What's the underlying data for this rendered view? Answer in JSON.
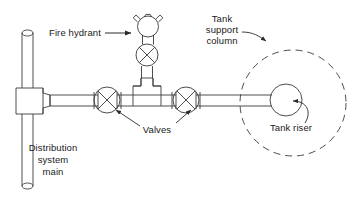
{
  "diagram": {
    "type": "piping-schematic",
    "background_color": "#ffffff",
    "line_color": "#3a3a3a",
    "text_color": "#1a1a1a",
    "canvas": {
      "width": 364,
      "height": 199
    }
  },
  "labels": {
    "fire_hydrant": "Fire hydrant",
    "tank_support_column_line1": "Tank",
    "tank_support_column_line2": "support",
    "tank_support_column_line3": "column",
    "valves": "Valves",
    "tank_riser": "Tank riser",
    "distribution_main_line1": "Distribution",
    "distribution_main_line2": "system",
    "distribution_main_line3": "main"
  },
  "components": [
    {
      "name": "distribution-system-main",
      "shape": "vertical-pipe",
      "x": 22,
      "y_top": 30,
      "y_bottom": 190,
      "width": 15
    },
    {
      "name": "main-tee-fitting",
      "shape": "tee",
      "x": 16,
      "y": 88,
      "width": 27,
      "height": 26
    },
    {
      "name": "branch-pipe",
      "shape": "horizontal-pipe",
      "y": 100,
      "x_start": 43,
      "x_end": 270,
      "width": 11
    },
    {
      "name": "valve-left",
      "shape": "gate-valve",
      "cx": 107,
      "cy": 100,
      "r": 13
    },
    {
      "name": "valve-right",
      "shape": "gate-valve",
      "cx": 186,
      "cy": 100,
      "r": 13
    },
    {
      "name": "hydrant-tee-fitting",
      "shape": "tee",
      "cx": 147,
      "cy": 100
    },
    {
      "name": "hydrant-riser-pipe",
      "shape": "vertical-pipe",
      "cx": 147,
      "y_top": 38,
      "y_bottom": 86,
      "width": 11
    },
    {
      "name": "hydrant-valve",
      "shape": "gate-valve",
      "cx": 147,
      "cy": 55,
      "r": 11
    },
    {
      "name": "hydrant-body",
      "shape": "circle-with-nozzles",
      "cx": 149,
      "cy": 27,
      "r": 11
    },
    {
      "name": "tank-riser",
      "shape": "circle",
      "cx": 286,
      "cy": 100,
      "r": 16
    },
    {
      "name": "tank-support-column",
      "shape": "dashed-circle",
      "cx": 293,
      "cy": 103,
      "r": 53
    }
  ],
  "leaders": [
    {
      "name": "fire-hydrant-leader",
      "style": "arrow",
      "from": [
        104,
        33
      ],
      "to": [
        133,
        33
      ]
    },
    {
      "name": "tank-support-column-leader",
      "style": "arrow-curve",
      "from": [
        242,
        33
      ],
      "to": [
        268,
        42
      ]
    },
    {
      "name": "valves-leader-left",
      "style": "arrow",
      "from": [
        141,
        127
      ],
      "to": [
        113,
        110
      ]
    },
    {
      "name": "valves-leader-right",
      "style": "arrow",
      "from": [
        175,
        122
      ],
      "to": [
        192,
        110
      ]
    },
    {
      "name": "tank-riser-leader",
      "style": "curve-arrow",
      "from": [
        300,
        120
      ],
      "to": [
        290,
        104
      ]
    }
  ]
}
